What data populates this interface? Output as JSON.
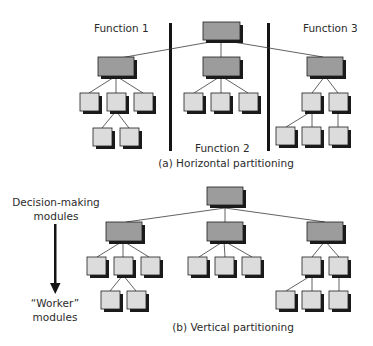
{
  "figure": {
    "panel_a": {
      "caption": "(a) Horizontal partitioning",
      "function_labels": [
        "Function 1",
        "Function 2",
        "Function 3"
      ]
    },
    "panel_b": {
      "caption": "(b) Vertical partitioning",
      "axis_top_label": "Decision-making\nmodules",
      "axis_top_line1": "Decision-making",
      "axis_top_line2": "modules",
      "axis_bottom_line1": "“Worker”",
      "axis_bottom_line2": "modules"
    },
    "colors": {
      "decision_box_fill": "#9c9c9c",
      "worker_box_fill": "#dcdcdc",
      "box_border": "#1e1e1e",
      "shadow": "#1a1a1a",
      "line": "#3a3a3a",
      "divider": "#141414"
    }
  }
}
